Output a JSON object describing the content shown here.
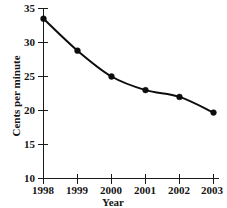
{
  "chart_data": {
    "type": "line",
    "title": "",
    "subtitle": "",
    "xlabel": "Year",
    "ylabel": "Cents per minute",
    "categories": [
      "1998",
      "1999",
      "2000",
      "2001",
      "2002",
      "2003"
    ],
    "x": [
      1998,
      1999,
      2000,
      2001,
      2002,
      2003
    ],
    "values": [
      33.5,
      28.8,
      25.0,
      23.0,
      22.0,
      19.7
    ],
    "series": [
      {
        "name": "Cents per minute",
        "values": [
          33.5,
          28.8,
          25.0,
          23.0,
          22.0,
          19.7
        ],
        "color": "#0d0d0d",
        "marker": "filled-circle"
      }
    ],
    "xlim": [
      1998,
      2003
    ],
    "ylim": [
      10,
      35
    ],
    "ytick_labels": [
      "10",
      "15",
      "20",
      "25",
      "30",
      "35"
    ],
    "yticks": [
      10,
      15,
      20,
      25,
      30,
      35
    ],
    "xtick_labels": [
      "1998",
      "1999",
      "2000",
      "2001",
      "2002",
      "2003"
    ],
    "xticks": [
      1998,
      1999,
      2000,
      2001,
      2002,
      2003
    ],
    "grid": false,
    "legend": false,
    "legend_position": "none",
    "annotations": []
  },
  "style": {
    "background": "#ffffff",
    "ink": "#0d0d0d",
    "axis_color": "#1a1a1a"
  }
}
